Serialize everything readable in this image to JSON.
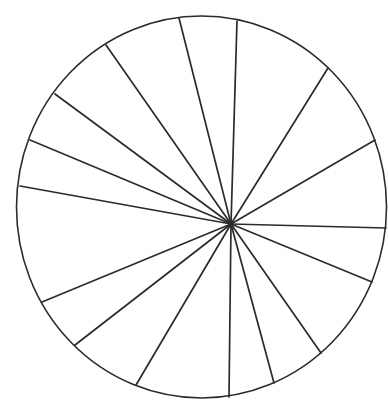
{
  "canvas": {
    "width": 388,
    "height": 405,
    "background": "#ffffff"
  },
  "style": {
    "stroke": "#2b2b2b"
  },
  "chart_data": {
    "type": "pie",
    "title": "",
    "labels_visible": false,
    "legend": null,
    "slice_count": 16,
    "outline": {
      "cx": 201.5,
      "cy": 207,
      "rx": 185,
      "ry": 191
    },
    "hub": {
      "x": 231,
      "y": 224
    },
    "spoke_endpoints": [
      [
        179,
        18
      ],
      [
        237,
        21
      ],
      [
        328,
        68
      ],
      [
        375,
        140
      ],
      [
        386,
        228
      ],
      [
        372,
        282
      ],
      [
        321,
        353
      ],
      [
        274,
        383
      ],
      [
        229,
        397
      ],
      [
        136,
        385
      ],
      [
        75,
        345
      ],
      [
        42,
        302
      ],
      [
        20,
        186
      ],
      [
        30,
        140
      ],
      [
        55,
        94
      ],
      [
        106,
        45
      ]
    ],
    "categories": [
      "S1",
      "S2",
      "S3",
      "S4",
      "S5",
      "S6",
      "S7",
      "S8",
      "S9",
      "S10",
      "S11",
      "S12",
      "S13",
      "S14",
      "S15",
      "S16"
    ],
    "values_degrees": [
      15.9,
      30.2,
      27.8,
      31.8,
      20.9,
      32.7,
      19.8,
      15.8,
      29.8,
      21.7,
      15.4,
      32.6,
      12.5,
      13.7,
      18.7,
      20.7
    ],
    "fill": "#ffffff"
  }
}
